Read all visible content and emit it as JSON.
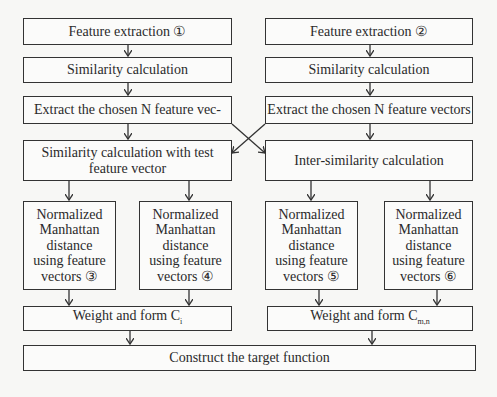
{
  "diagram": {
    "left_column": {
      "feature_extraction": "Feature extraction ①",
      "similarity": "Similarity calculation",
      "extract": "Extract the chosen N feature vec-",
      "test_similarity_line1": "Similarity calculation with test",
      "test_similarity_line2": "feature vector",
      "manhattan_3": [
        "Normalized",
        "Manhattan",
        "distance",
        "using feature",
        "vectors ③"
      ],
      "manhattan_4": [
        "Normalized",
        "Manhattan",
        "distance",
        "using feature",
        "vectors ④"
      ],
      "weight_label": "Weight and form C",
      "weight_sub": "i"
    },
    "right_column": {
      "feature_extraction": "Feature extraction ②",
      "similarity": "Similarity calculation",
      "extract": "Extract the chosen N feature vectors",
      "inter_similarity": "Inter-similarity calculation",
      "manhattan_5": [
        "Normalized",
        "Manhattan",
        "distance",
        "using feature",
        "vectors ⑤"
      ],
      "manhattan_6": [
        "Normalized",
        "Manhattan",
        "distance",
        "using feature",
        "vectors ⑥"
      ],
      "weight_label": "Weight and form C",
      "weight_sub": "m,n"
    },
    "bottom": {
      "target": "Construct the target function"
    }
  }
}
